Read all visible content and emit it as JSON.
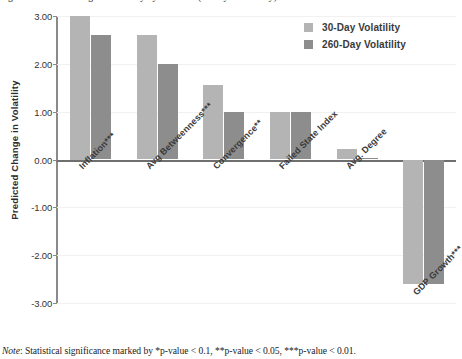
{
  "figure": {
    "clipped_title": "Figure: Predicted change in volatility by covariate (30-day vs 260-day)",
    "note_lead": "Note",
    "note_text": ": Statistical significance marked by *p-value < 0.1, **p-value < 0.05, ***p-value < 0.01."
  },
  "legend": {
    "items": [
      {
        "label": "30-Day Volatility",
        "color": "#b4b4b4"
      },
      {
        "label": "260-Day Volatility",
        "color": "#8d8d8d"
      }
    ]
  },
  "chart_data": {
    "type": "bar",
    "title": "",
    "xlabel": "",
    "ylabel": "Predicted Change in Volatility",
    "ylim": [
      -3.0,
      3.0
    ],
    "yticks": [
      "3.00",
      "2.00",
      "1.00",
      "0.00",
      "-1.00",
      "-2.00",
      "-3.00"
    ],
    "ytick_values": [
      3.0,
      2.0,
      1.0,
      0.0,
      -1.0,
      -2.0,
      -3.0
    ],
    "grid": true,
    "legend_position": "top-right",
    "categories": [
      "Inflation",
      "Avg Betweenness",
      "Convergence",
      "Failed State Index",
      "Avg. Degree",
      "GDP Growth"
    ],
    "category_significance": [
      "***",
      "***",
      "**",
      "",
      "",
      "***"
    ],
    "category_labels": [
      "Inflation***",
      "Avg Betweenness***",
      "Convergence**",
      "Failed State Index",
      "Avg. Degree",
      "GDP Growth***"
    ],
    "series": [
      {
        "name": "30-Day Volatility",
        "color": "#b4b4b4",
        "values": [
          3.0,
          2.6,
          1.55,
          1.0,
          0.22,
          -2.6
        ]
      },
      {
        "name": "260-Day Volatility",
        "color": "#8d8d8d",
        "values": [
          2.6,
          2.0,
          1.0,
          1.0,
          0.03,
          -2.6
        ]
      }
    ]
  }
}
